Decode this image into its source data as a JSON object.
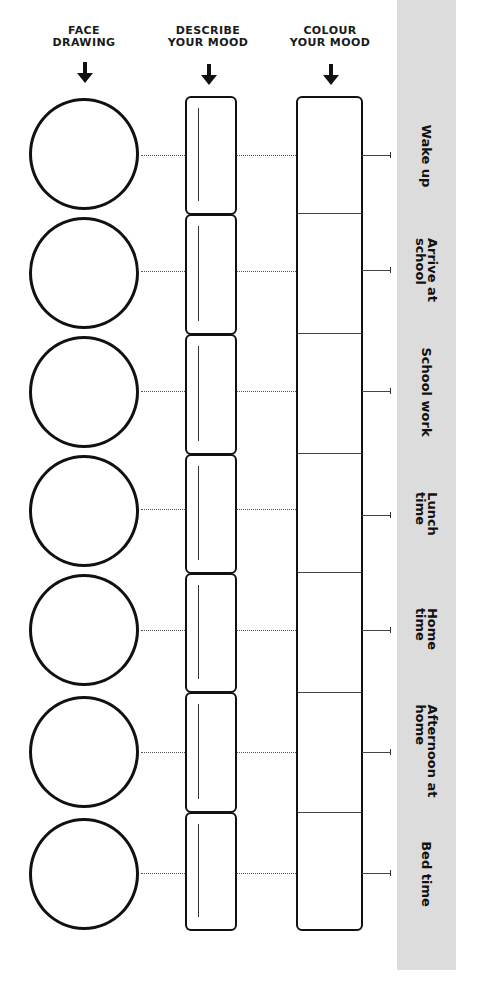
{
  "columns": {
    "face": {
      "line1": "FACE",
      "line2": "DRAWING",
      "arrow_icon": "down-arrow-icon"
    },
    "describe": {
      "line1": "DESCRIBE",
      "line2": "YOUR MOOD",
      "arrow_icon": "down-arrow-icon"
    },
    "colour": {
      "line1": "COLOUR",
      "line2": "YOUR MOOD",
      "arrow_icon": "down-arrow-icon"
    }
  },
  "rows": [
    {
      "line1": "Wake up",
      "line2": ""
    },
    {
      "line1": "Arrive at",
      "line2": "school"
    },
    {
      "line1": "School work",
      "line2": ""
    },
    {
      "line1": "Lunch",
      "line2": "time"
    },
    {
      "line1": "Home",
      "line2": "time"
    },
    {
      "line1": "Afternoon at",
      "line2": "home"
    },
    {
      "line1": "Bed time",
      "line2": ""
    }
  ],
  "colors": {
    "ink": "#111111",
    "panel": "#dcdcdc",
    "background": "#ffffff"
  }
}
